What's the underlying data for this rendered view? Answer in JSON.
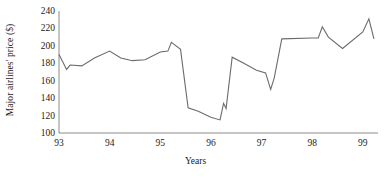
{
  "chart_data": {
    "type": "line",
    "title": "",
    "xlabel": "Years",
    "ylabel": "Major airlines' price ($)",
    "xlim": [
      93.0,
      99.3
    ],
    "ylim": [
      100,
      240
    ],
    "grid": false,
    "legend": "none",
    "yticks": [
      240,
      220,
      200,
      180,
      160,
      140,
      120,
      100
    ],
    "xticks": [
      "93",
      "94",
      "95",
      "96",
      "97",
      "98",
      "99"
    ],
    "xtick_values": [
      93,
      94,
      95,
      96,
      97,
      98,
      99
    ],
    "line_color": "#6b6b6b",
    "series": [
      {
        "name": "Major airlines' price",
        "x": [
          93.0,
          93.15,
          93.22,
          93.45,
          93.7,
          94.0,
          94.22,
          94.45,
          94.7,
          95.0,
          95.15,
          95.22,
          95.4,
          95.55,
          95.75,
          96.0,
          96.18,
          96.25,
          96.3,
          96.42,
          96.65,
          96.9,
          97.08,
          97.18,
          97.25,
          97.4,
          98.0,
          98.12,
          98.2,
          98.32,
          98.6,
          99.0,
          99.12,
          99.22
        ],
        "y": [
          190,
          173,
          178,
          177,
          186,
          194,
          186,
          183,
          184,
          193,
          194,
          204,
          196,
          129,
          125,
          118,
          115,
          134,
          128,
          187,
          180,
          172,
          169,
          150,
          163,
          208,
          209,
          209,
          222,
          210,
          197,
          216,
          231,
          208
        ]
      }
    ]
  },
  "axis": {
    "y_label": "Major airlines' price ($)",
    "x_label": "Years"
  }
}
